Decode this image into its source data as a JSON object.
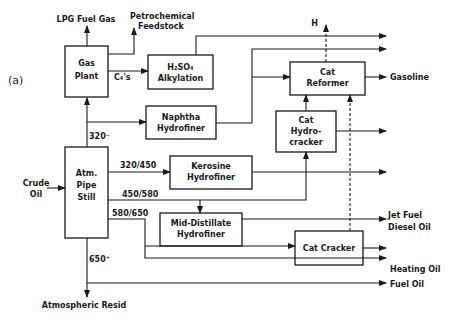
{
  "figure": {
    "panel_label": "(a)"
  },
  "units": {
    "gas_plant": [
      "Gas",
      "Plant"
    ],
    "alkylation": [
      "H₂SO₄",
      "Alkylation"
    ],
    "naphtha_hydrofiner": [
      "Naphtha",
      "Hydrofiner"
    ],
    "cat_reformer": [
      "Cat",
      "Reformer"
    ],
    "cat_hydrocracker": [
      "Cat",
      "Hydro-",
      "cracker"
    ],
    "atm_pipe_still": [
      "Atm.",
      "Pipe",
      "Still"
    ],
    "kerosine_hydrofiner": [
      "Kerosine",
      "Hydrofiner"
    ],
    "mid_distillate_hydrofiner": [
      "Mid-Distillate",
      "Hydrofiner"
    ],
    "cat_cracker": [
      "Cat Cracker"
    ]
  },
  "streams": {
    "crude_oil": [
      "Crude",
      "Oil"
    ],
    "lpg_fuel_gas": "LPG Fuel Gas",
    "petrochemical_feedstock": [
      "Petrochemical",
      "Feedstock"
    ],
    "c4s": "C₄'s",
    "cut_320": "320⁻",
    "cut_320_450": "320/450",
    "cut_450_580": "450/580",
    "cut_580_650": "580/650",
    "cut_650": "650⁺",
    "hydrogen": "H",
    "gasoline": "Gasoline",
    "jet_fuel_diesel": [
      "Jet Fuel",
      "Diesel Oil"
    ],
    "heating_oil": "Heating Oil",
    "fuel_oil": "Fuel Oil",
    "atmospheric_resid": "Atmospheric Resid"
  }
}
